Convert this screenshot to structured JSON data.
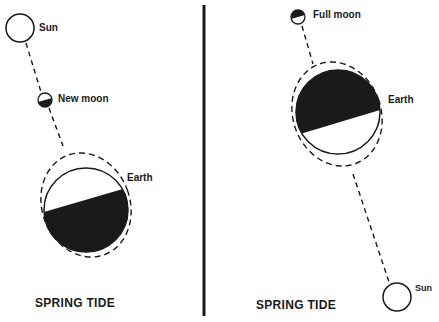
{
  "left_panel": {
    "sun_label": "Sun",
    "moon_label": "New moon",
    "earth_label": "Earth",
    "caption": "SPRING TIDE"
  },
  "right_panel": {
    "sun_label": "Sun",
    "moon_label": "Full moon",
    "earth_label": "Earth",
    "caption": "SPRING TIDE"
  },
  "colors": {
    "ink": "#1a1a1a",
    "background": "#ffffff"
  }
}
